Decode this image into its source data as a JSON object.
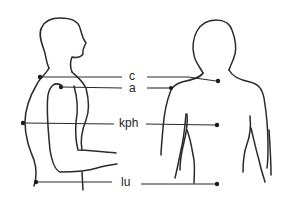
{
  "diagram": {
    "type": "anatomical measurement points",
    "views": [
      "side-profile",
      "back-view"
    ],
    "labels": [
      {
        "id": "c",
        "text": "c"
      },
      {
        "id": "a",
        "text": "a"
      },
      {
        "id": "kph",
        "text": "kph"
      },
      {
        "id": "lu",
        "text": "lu"
      }
    ],
    "colors": {
      "line": "#2a2a2a",
      "background": "#ffffff"
    }
  }
}
